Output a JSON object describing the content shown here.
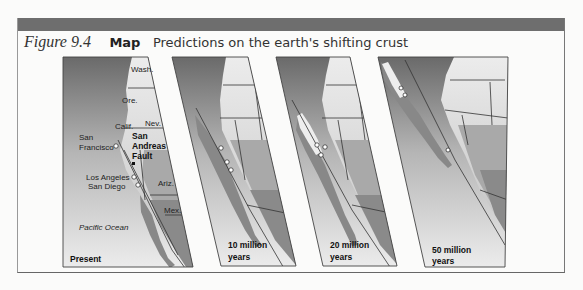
{
  "figure": {
    "number": "Figure 9.4",
    "type_label": "Map",
    "title": "Predictions on the earth's shifting crust"
  },
  "panels": [
    {
      "label": "Present",
      "place_labels": {
        "wash": "Wash.",
        "ore": "Ore.",
        "calif": "Calif.",
        "nev": "Nev.",
        "ariz": "Ariz.",
        "mex": "Mex.",
        "san_francisco_1": "San",
        "san_francisco_2": "Francisco",
        "fault_1": "San",
        "fault_2": "Andreas",
        "fault_3": "Fault",
        "los_angeles": "Los Angeles",
        "san_diego": "San Diego",
        "ocean": "Pacific Ocean"
      }
    },
    {
      "label_1": "10 million",
      "label_2": "years"
    },
    {
      "label_1": "20 million",
      "label_2": "years"
    },
    {
      "label_1": "50 million",
      "label_2": "years"
    }
  ],
  "colors": {
    "ocean_dark": "#6f6f6f",
    "ocean_light": "#e6e6e6",
    "land_light": "#d8d8d8",
    "land_mid": "#a9a9a9",
    "land_dark": "#7d7d7d",
    "topbar": "#6e6e6e"
  }
}
